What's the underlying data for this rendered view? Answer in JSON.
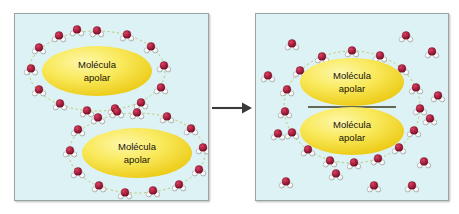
{
  "figure": {
    "background_color": "#ffffff",
    "width": 459,
    "height": 214
  },
  "colors": {
    "panel_background": "#ddf2f4",
    "panel_border": "#9aa3a6",
    "oxygen": "#a31b3c",
    "oxygen_highlight": "#d8415f",
    "hydrogen": "#ffffff",
    "hydrogen_outline": "#8d8d8d",
    "hydrogen_bond": "#b9c96a",
    "blob_fill": "#f5e03a",
    "blob_highlight": "#fdf7a8",
    "blob_edge": "#e9c21b",
    "blob_label_text": "#17120a",
    "arrow": "#3a3a3a",
    "divider_line": "#3a3a20"
  },
  "arrow": {
    "name": "process-arrow",
    "direction": "right",
    "label": ""
  },
  "panels": [
    {
      "id": "before",
      "name": "panel-before",
      "caption": "",
      "blobs": [
        {
          "label_line1": "Molécula",
          "label_line2": "apolar",
          "cx": 82,
          "cy": 57,
          "rx": 55,
          "ry": 25
        },
        {
          "label_line1": "Molécula",
          "label_line2": "apolar",
          "cx": 122,
          "cy": 139,
          "rx": 55,
          "ry": 25
        }
      ],
      "cages": [
        {
          "name": "water-cage-upper",
          "cx": 82,
          "cy": 57,
          "rx": 70,
          "ry": 42,
          "count": 14
        },
        {
          "name": "water-cage-lower",
          "cx": 122,
          "cy": 139,
          "rx": 70,
          "ry": 42,
          "count": 14
        }
      ],
      "free_waters": []
    },
    {
      "id": "after",
      "name": "panel-after",
      "caption": "",
      "blobs": [
        {
          "label_line1": "Molécula",
          "label_line2": "apolar",
          "cx": 96,
          "cy": 68,
          "rx": 52,
          "ry": 24
        },
        {
          "label_line1": "Molécula",
          "label_line2": "apolar",
          "cx": 96,
          "cy": 117,
          "rx": 52,
          "ry": 24
        }
      ],
      "cages": [
        {
          "name": "water-cage-shared",
          "cx": 96,
          "cy": 93,
          "rx": 70,
          "ry": 58,
          "count": 20
        }
      ],
      "free_waters": [
        {
          "x": 36,
          "y": 30
        },
        {
          "x": 150,
          "y": 22
        },
        {
          "x": 176,
          "y": 38
        },
        {
          "x": 12,
          "y": 62
        },
        {
          "x": 182,
          "y": 82
        },
        {
          "x": 174,
          "y": 105
        },
        {
          "x": 22,
          "y": 120
        },
        {
          "x": 168,
          "y": 148
        },
        {
          "x": 30,
          "y": 168
        },
        {
          "x": 80,
          "y": 160
        },
        {
          "x": 118,
          "y": 172
        },
        {
          "x": 156,
          "y": 172
        }
      ]
    }
  ]
}
